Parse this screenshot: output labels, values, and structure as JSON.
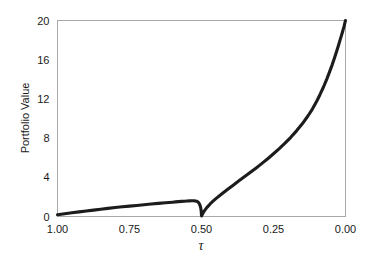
{
  "chart_data": {
    "type": "line",
    "title": "",
    "subtitle": "",
    "xlabel": "τ",
    "ylabel": "Portfolio Value",
    "xlim": [
      1.0,
      0.0
    ],
    "ylim": [
      0,
      20
    ],
    "x_reversed": true,
    "grid": false,
    "legend": null,
    "legend_position": "none",
    "xticks": [
      1.0,
      0.75,
      0.5,
      0.25,
      0.0
    ],
    "xtick_labels": [
      "1.00",
      "0.75",
      "0.50",
      "0.25",
      "0.00"
    ],
    "yticks": [
      0,
      4,
      8,
      12,
      16,
      20
    ],
    "ytick_labels": [
      "0",
      "4",
      "8",
      "12",
      "16",
      "20"
    ],
    "line_color": "#1c1c1c",
    "line_width": 3.1,
    "frame_color": "#a8a8a8",
    "background_color": "#ffffff",
    "annotations": [],
    "series": [
      {
        "name": "Portfolio Value",
        "x": [
          1.0,
          0.975,
          0.95,
          0.925,
          0.9,
          0.875,
          0.85,
          0.825,
          0.8,
          0.775,
          0.75,
          0.725,
          0.7,
          0.675,
          0.65,
          0.625,
          0.6,
          0.59,
          0.58,
          0.57,
          0.56,
          0.55,
          0.542,
          0.535,
          0.528,
          0.522,
          0.517,
          0.513,
          0.51,
          0.507,
          0.505,
          0.503,
          0.502,
          0.501,
          0.5005,
          0.5,
          0.4995,
          0.499,
          0.498,
          0.496,
          0.493,
          0.49,
          0.485,
          0.48,
          0.47,
          0.46,
          0.45,
          0.43,
          0.41,
          0.39,
          0.37,
          0.35,
          0.33,
          0.31,
          0.29,
          0.27,
          0.25,
          0.23,
          0.21,
          0.19,
          0.17,
          0.15,
          0.13,
          0.115,
          0.1,
          0.088,
          0.076,
          0.065,
          0.055,
          0.046,
          0.038,
          0.031,
          0.025,
          0.02,
          0.015,
          0.011,
          0.008,
          0.005,
          0.003,
          0.0015,
          0.0
        ],
        "y": [
          0.18,
          0.28,
          0.38,
          0.47,
          0.56,
          0.65,
          0.74,
          0.83,
          0.91,
          0.99,
          1.06,
          1.13,
          1.2,
          1.27,
          1.34,
          1.4,
          1.46,
          1.49,
          1.52,
          1.54,
          1.56,
          1.58,
          1.59,
          1.6,
          1.6,
          1.59,
          1.56,
          1.5,
          1.42,
          1.28,
          1.12,
          0.92,
          0.76,
          0.54,
          0.35,
          0.12,
          0.06,
          0.09,
          0.16,
          0.28,
          0.44,
          0.58,
          0.78,
          0.96,
          1.28,
          1.56,
          1.82,
          2.3,
          2.76,
          3.2,
          3.64,
          4.08,
          4.52,
          4.96,
          5.42,
          5.9,
          6.4,
          6.92,
          7.48,
          8.08,
          8.74,
          9.46,
          10.28,
          10.96,
          11.76,
          12.48,
          13.24,
          14.02,
          14.78,
          15.5,
          16.2,
          16.84,
          17.4,
          17.9,
          18.38,
          18.78,
          19.1,
          19.4,
          19.66,
          19.84,
          20.0
        ]
      }
    ]
  },
  "axes": {
    "y_axis_title": "Portfolio Value",
    "x_axis_title": "τ"
  }
}
